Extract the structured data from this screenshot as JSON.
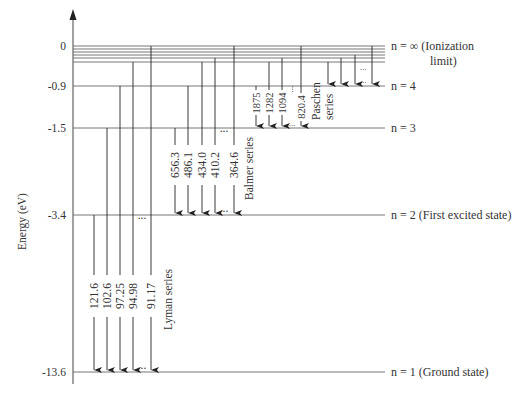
{
  "diagram": {
    "axis": {
      "label": "Energy (eV)",
      "ticks": [
        "0",
        "-0.9",
        "-1.5",
        "-3.4",
        "-13.6"
      ]
    },
    "levels": [
      {
        "n": "∞",
        "energy": 0,
        "label": "n =  ∞ (Ionization",
        "label_line2": "limit)",
        "y": 46
      },
      {
        "n": "4",
        "energy": -0.9,
        "label": "n = 4",
        "y": 86
      },
      {
        "n": "3",
        "energy": -1.5,
        "label": "n = 3",
        "y": 128
      },
      {
        "n": "2",
        "energy": -3.4,
        "label": "n = 2 (First excited state)",
        "y": 215
      },
      {
        "n": "1",
        "energy": -13.6,
        "label": "n = 1 (Ground state)",
        "y": 372
      }
    ],
    "upper_bunched_levels_y": [
      46,
      49,
      52,
      55,
      58,
      62
    ],
    "series": [
      {
        "name": "Lyman series",
        "final_level": "n = 1",
        "wavelengths_nm": [
          "121.6",
          "102.6",
          "97.25",
          "94.98",
          "91.17"
        ]
      },
      {
        "name": "Balmer series",
        "final_level": "n = 2",
        "wavelengths_nm": [
          "656.3",
          "486.1",
          "434.0",
          "410.2",
          "364.6"
        ]
      },
      {
        "name": "Paschen series",
        "final_level": "n = 3",
        "wavelengths_nm": [
          "1875",
          "1282",
          "1094",
          "820.4"
        ]
      },
      {
        "name": "",
        "final_level": "n = 4",
        "wavelengths_nm": []
      }
    ],
    "ellipsis": "..."
  }
}
